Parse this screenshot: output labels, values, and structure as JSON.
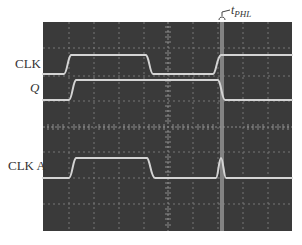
{
  "figure": {
    "annotation": {
      "symbol": "t",
      "subscript": "PHL"
    },
    "channels": [
      {
        "label": "CLK",
        "italic": false
      },
      {
        "label": "Q",
        "italic": true
      },
      {
        "label": "CLK A",
        "italic": false
      }
    ],
    "colors": {
      "screen": "#3a3a3a",
      "grid": "#8a8a8a",
      "trace": "#d4d4d4",
      "highlight": "#8c8c8c",
      "label": "#333333"
    },
    "grid": {
      "horizontal_divisions": 10,
      "vertical_divisions": 8
    }
  }
}
